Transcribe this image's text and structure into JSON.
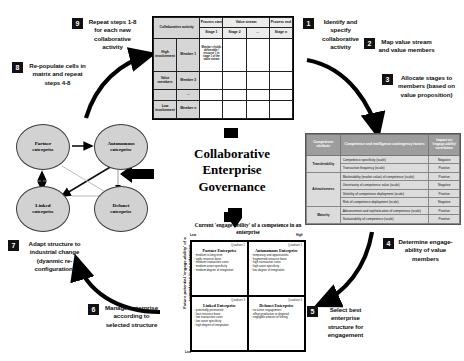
{
  "centre": {
    "title_line1": "Collaborative",
    "title_line2": "Enterprise",
    "title_line3": "Governance"
  },
  "steps": [
    {
      "num": "1",
      "text": "Identify and specify collaborative activity"
    },
    {
      "num": "2",
      "text": "Map value stream and value members"
    },
    {
      "num": "3",
      "text": "Allocate stages to members (based on value proposition)"
    },
    {
      "num": "4",
      "text": "Determine engage-ability of value members"
    },
    {
      "num": "5",
      "text": "Select best enterprise structure for engagement"
    },
    {
      "num": "6",
      "text": "Manage enterprise according to selected structure"
    },
    {
      "num": "7",
      "text": "Adapt structure to industrial change (dyanmic re-configuration)"
    },
    {
      "num": "8",
      "text": "Re-populate cells in matrix and repeat steps 4-8"
    },
    {
      "num": "9",
      "text": "Repeat steps 1-8 for each new collaborative activity"
    }
  ],
  "value_stream_matrix": {
    "corner_label": "Collaborative activity",
    "header_group": "Value stream",
    "header_first": "Process start",
    "header_last": "Process end",
    "stage_columns": [
      "Stage 1",
      "Stage 2",
      "...",
      "Stage n"
    ],
    "axis_top": "High involvement",
    "axis_mid": "Value members",
    "axis_bottom": "Low involvement",
    "member_rows": [
      "Member 1",
      "Member 2",
      "...",
      "Member n"
    ],
    "sample_cell": "Member x holds deliverable / resource 1 in stage 1 of the value stream"
  },
  "competence_table": {
    "headers": [
      "Competence attribute",
      "Competence and intelligence contingency factors",
      "Impact on 'engage-ability' correlation"
    ],
    "rows": [
      {
        "attribute": "Transferability",
        "factors": [
          "Competence specificity (scale)",
          "Transaction frequency (scale)"
        ],
        "impacts": [
          "Negative",
          "Positive"
        ]
      },
      {
        "attribute": "Attractiveness",
        "factors": [
          "Marketability (market value) of competence (scale)",
          "Uncertainty of competence value (scale)",
          "Volatility of competence deployment (scale)",
          "Risk of competence deployment (scale)"
        ],
        "impacts": [
          "Positive",
          "Negative",
          "Positive",
          "Negative"
        ]
      },
      {
        "attribute": "Maturity",
        "factors": [
          "Advancement and sophistication of competence (scale)",
          "Sustainability of competence (scale)"
        ],
        "impacts": [
          "Positive",
          "Positive"
        ]
      }
    ]
  },
  "engage_matrix": {
    "title_line1": "Current 'engage-ability' of a competence",
    "title_line2": "in an enterprise",
    "y_axis_label": "Future potential 'engage-ability' of a competence in an enterprise",
    "x_axis_label": "",
    "axis_low_left": "Low",
    "axis_high_right": "High",
    "axis_low_bottom": "Low",
    "quadrants": [
      {
        "number": "Quadrant 2",
        "title": "Partner Enterprise",
        "items": [
          "medium to long-term",
          "agile resource base",
          "medium transaction costs",
          "medium asset specificity",
          "medium degree of integration"
        ]
      },
      {
        "number": "Quadrant 1",
        "title": "Autonomous Enterprise",
        "items": [
          "temporary and opportunistic",
          "fragmented resource base",
          "high transaction costs",
          "high asset specificity",
          "low degree of integration"
        ]
      },
      {
        "number": "Quadrant 3",
        "title": "Linked Enterprise",
        "items": [
          "potentially permanent",
          "lean resource base",
          "low transaction costs",
          "low asset specificity",
          "high degree of integration"
        ]
      },
      {
        "number": "Quadrant 4",
        "title": "Defunct Enterprise",
        "items": [
          "no active engagement",
          "offset production or disposal",
          "negligible amount of linking"
        ]
      }
    ]
  },
  "enterprise_network": {
    "nodes": [
      {
        "id": "partner",
        "label_line1": "Partner",
        "label_line2": "enterprise"
      },
      {
        "id": "autonomous",
        "label_line1": "Autonomous",
        "label_line2": "enterprise"
      },
      {
        "id": "linked",
        "label_line1": "Linked",
        "label_line2": "enterprise"
      },
      {
        "id": "defunct",
        "label_line1": "Defunct",
        "label_line2": "enterprise"
      }
    ]
  },
  "colors": {
    "node_fill": "#d2d2d2",
    "table_header": "#9d9d9d",
    "table_body": "#dcdcdc",
    "arrow": "#000000"
  }
}
